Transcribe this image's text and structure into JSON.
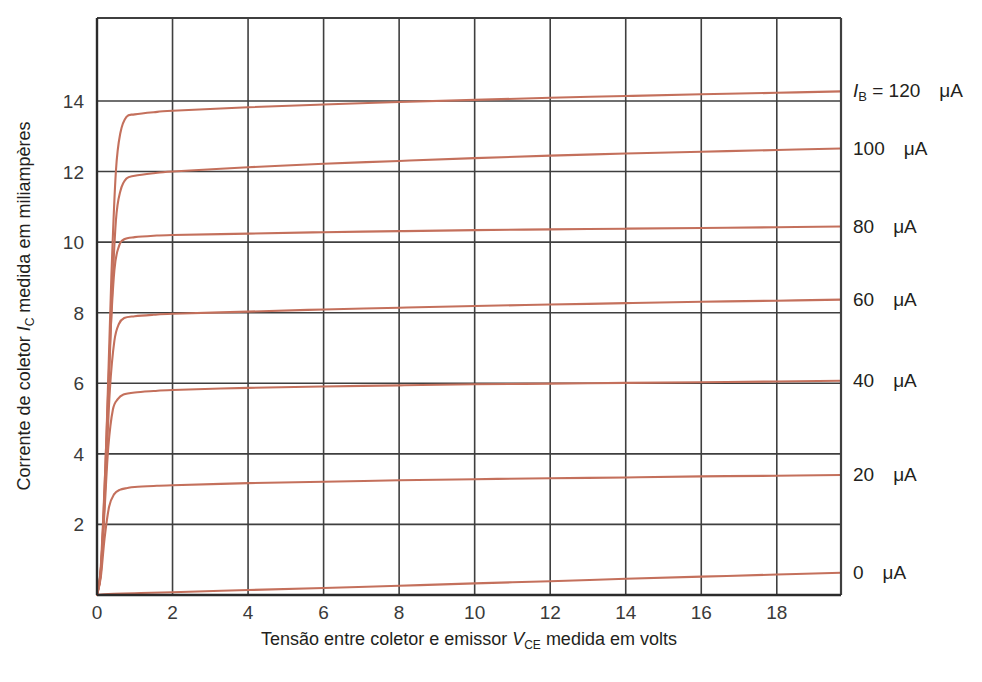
{
  "chart_data": {
    "type": "line",
    "title": "",
    "xlabel": "Tensão entre coletor e emissor V_CE medida em volts",
    "ylabel": "Corrente de coletor I_C medida em miliampères",
    "xlabel_parts": {
      "pre": "Tensão entre coletor e emissor ",
      "sym": "V",
      "sub": "CE",
      "post": " medida em volts"
    },
    "ylabel_parts": {
      "pre": "Corrente de coletor ",
      "sym": "I",
      "sub": "C",
      "post": " medida em miliampères"
    },
    "xlim": [
      0,
      19.7
    ],
    "ylim": [
      0,
      16.35
    ],
    "xticks": [
      0,
      2,
      4,
      6,
      8,
      10,
      12,
      14,
      16,
      18
    ],
    "xticklabels": [
      "0",
      "2",
      "4",
      "6",
      "8",
      "10",
      "12",
      "14",
      "16",
      "18"
    ],
    "yticks": [
      2,
      4,
      6,
      8,
      10,
      12,
      14
    ],
    "yticklabels": [
      "2",
      "4",
      "6",
      "8",
      "10",
      "12",
      "14"
    ],
    "grid": true,
    "grid_color": "#3f3f3f",
    "curve_color": "#c4705c",
    "legend_position": "right-of-axes",
    "xunit": "V",
    "yunit": "mA",
    "series": [
      {
        "name": "IB = 120 uA",
        "ib_ua": 120,
        "knee_v": 0.75,
        "sat_ma": 13.6,
        "end_ma": 14.25,
        "points": [
          [
            0,
            0
          ],
          [
            0.12,
            1.0
          ],
          [
            0.25,
            4.5
          ],
          [
            0.38,
            9.0
          ],
          [
            0.5,
            12.0
          ],
          [
            0.62,
            13.1
          ],
          [
            0.78,
            13.55
          ],
          [
            1.0,
            13.62
          ],
          [
            1.5,
            13.68
          ],
          [
            2,
            13.72
          ],
          [
            4,
            13.82
          ],
          [
            6,
            13.9
          ],
          [
            8,
            13.97
          ],
          [
            10,
            14.03
          ],
          [
            12,
            14.09
          ],
          [
            14,
            14.14
          ],
          [
            16,
            14.19
          ],
          [
            18,
            14.23
          ],
          [
            19.7,
            14.27
          ]
        ]
      },
      {
        "name": "100 uA",
        "ib_ua": 100,
        "knee_v": 0.7,
        "sat_ma": 11.85,
        "end_ma": 12.62,
        "points": [
          [
            0,
            0
          ],
          [
            0.12,
            0.9
          ],
          [
            0.25,
            4.0
          ],
          [
            0.38,
            8.0
          ],
          [
            0.5,
            10.6
          ],
          [
            0.62,
            11.45
          ],
          [
            0.78,
            11.8
          ],
          [
            1.0,
            11.88
          ],
          [
            1.5,
            11.95
          ],
          [
            2,
            12.0
          ],
          [
            4,
            12.12
          ],
          [
            6,
            12.22
          ],
          [
            8,
            12.3
          ],
          [
            10,
            12.38
          ],
          [
            12,
            12.45
          ],
          [
            14,
            12.51
          ],
          [
            16,
            12.56
          ],
          [
            18,
            12.61
          ],
          [
            19.7,
            12.65
          ]
        ]
      },
      {
        "name": "80 uA",
        "ib_ua": 80,
        "knee_v": 0.6,
        "sat_ma": 10.05,
        "end_ma": 10.42,
        "points": [
          [
            0,
            0
          ],
          [
            0.1,
            0.8
          ],
          [
            0.22,
            3.6
          ],
          [
            0.34,
            7.0
          ],
          [
            0.46,
            9.2
          ],
          [
            0.58,
            9.88
          ],
          [
            0.72,
            10.08
          ],
          [
            1.0,
            10.14
          ],
          [
            1.5,
            10.18
          ],
          [
            2,
            10.2
          ],
          [
            4,
            10.24
          ],
          [
            6,
            10.28
          ],
          [
            8,
            10.31
          ],
          [
            10,
            10.34
          ],
          [
            12,
            10.36
          ],
          [
            14,
            10.38
          ],
          [
            16,
            10.4
          ],
          [
            18,
            10.42
          ],
          [
            19.7,
            10.44
          ]
        ]
      },
      {
        "name": "60 uA",
        "ib_ua": 60,
        "knee_v": 0.6,
        "sat_ma": 7.82,
        "end_ma": 8.35,
        "points": [
          [
            0,
            0
          ],
          [
            0.1,
            0.7
          ],
          [
            0.22,
            3.1
          ],
          [
            0.34,
            5.8
          ],
          [
            0.46,
            7.2
          ],
          [
            0.58,
            7.68
          ],
          [
            0.72,
            7.85
          ],
          [
            1.0,
            7.9
          ],
          [
            1.5,
            7.94
          ],
          [
            2,
            7.97
          ],
          [
            4,
            8.03
          ],
          [
            6,
            8.09
          ],
          [
            8,
            8.14
          ],
          [
            10,
            8.19
          ],
          [
            12,
            8.23
          ],
          [
            14,
            8.27
          ],
          [
            16,
            8.31
          ],
          [
            18,
            8.34
          ],
          [
            19.7,
            8.37
          ]
        ]
      },
      {
        "name": "40 uA",
        "ib_ua": 40,
        "knee_v": 0.55,
        "sat_ma": 5.65,
        "end_ma": 6.05,
        "points": [
          [
            0,
            0
          ],
          [
            0.1,
            0.6
          ],
          [
            0.2,
            2.4
          ],
          [
            0.3,
            4.2
          ],
          [
            0.42,
            5.25
          ],
          [
            0.55,
            5.55
          ],
          [
            0.7,
            5.68
          ],
          [
            1.0,
            5.74
          ],
          [
            1.5,
            5.78
          ],
          [
            2,
            5.81
          ],
          [
            4,
            5.87
          ],
          [
            6,
            5.91
          ],
          [
            8,
            5.94
          ],
          [
            10,
            5.97
          ],
          [
            12,
            5.99
          ],
          [
            14,
            6.01
          ],
          [
            16,
            6.03
          ],
          [
            18,
            6.05
          ],
          [
            19.7,
            6.07
          ]
        ]
      },
      {
        "name": "20 uA",
        "ib_ua": 20,
        "knee_v": 0.5,
        "sat_ma": 2.95,
        "end_ma": 3.38,
        "points": [
          [
            0,
            0
          ],
          [
            0.1,
            0.5
          ],
          [
            0.2,
            1.6
          ],
          [
            0.32,
            2.5
          ],
          [
            0.45,
            2.85
          ],
          [
            0.6,
            2.98
          ],
          [
            0.8,
            3.03
          ],
          [
            1.0,
            3.06
          ],
          [
            1.5,
            3.09
          ],
          [
            2,
            3.11
          ],
          [
            4,
            3.17
          ],
          [
            6,
            3.21
          ],
          [
            8,
            3.25
          ],
          [
            10,
            3.28
          ],
          [
            12,
            3.31
          ],
          [
            14,
            3.33
          ],
          [
            16,
            3.36
          ],
          [
            18,
            3.38
          ],
          [
            19.7,
            3.4
          ]
        ]
      },
      {
        "name": "0 uA",
        "ib_ua": 0,
        "knee_v": 0.2,
        "sat_ma": 0.05,
        "end_ma": 0.62,
        "points": [
          [
            0,
            0
          ],
          [
            0.3,
            0.03
          ],
          [
            1,
            0.05
          ],
          [
            2,
            0.08
          ],
          [
            4,
            0.14
          ],
          [
            6,
            0.2
          ],
          [
            8,
            0.26
          ],
          [
            10,
            0.33
          ],
          [
            12,
            0.39
          ],
          [
            14,
            0.46
          ],
          [
            16,
            0.52
          ],
          [
            18,
            0.58
          ],
          [
            19.7,
            0.63
          ]
        ]
      }
    ],
    "annotations": [
      {
        "id": "lbl-120",
        "prefix_sym": "I",
        "prefix_sub": "B",
        "eq": " = ",
        "value": "120",
        "unit": "μA",
        "y_ma": 14.27
      },
      {
        "id": "lbl-100",
        "prefix_sym": "",
        "prefix_sub": "",
        "eq": "",
        "value": "100",
        "unit": "μA",
        "y_ma": 12.65
      },
      {
        "id": "lbl-80",
        "prefix_sym": "",
        "prefix_sub": "",
        "eq": "",
        "value": "80",
        "unit": "μA",
        "y_ma": 10.44
      },
      {
        "id": "lbl-60",
        "prefix_sym": "",
        "prefix_sub": "",
        "eq": "",
        "value": "60",
        "unit": "μA",
        "y_ma": 8.37
      },
      {
        "id": "lbl-40",
        "prefix_sym": "",
        "prefix_sub": "",
        "eq": "",
        "value": "40",
        "unit": "μA",
        "y_ma": 6.07
      },
      {
        "id": "lbl-20",
        "prefix_sym": "",
        "prefix_sub": "",
        "eq": "",
        "value": "20",
        "unit": "μA",
        "y_ma": 3.4
      },
      {
        "id": "lbl-0",
        "prefix_sym": "",
        "prefix_sub": "",
        "eq": "",
        "value": "0",
        "unit": "μA",
        "y_ma": 0.63
      }
    ]
  }
}
